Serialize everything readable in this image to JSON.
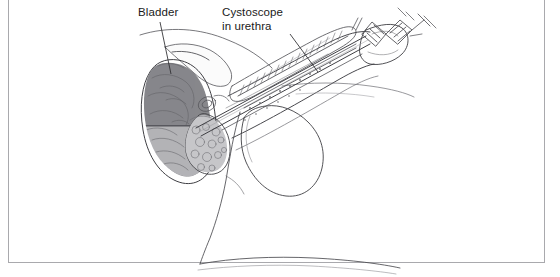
{
  "figure": {
    "view": "lateral cutaway",
    "background_color": "#ffffff",
    "frame": {
      "visible": true,
      "color": "#a9a9ad",
      "thickness_px": 1.5
    }
  },
  "labels": [
    {
      "id": "bladder",
      "text": "Bladder",
      "lines": [
        "Bladder"
      ],
      "x": 138,
      "y": 6,
      "color": "#1a1a1a",
      "leader": {
        "from_x": 160,
        "from_y": 22,
        "to_x": 171,
        "to_y": 72
      }
    },
    {
      "id": "cystoscope-in-urethra",
      "text": "Cystoscope in urethra",
      "lines": [
        "Cystoscope",
        "in urethra"
      ],
      "x": 222,
      "y": 6,
      "color": "#1a1a1a",
      "leader": {
        "from_x": 290,
        "from_y": 34,
        "to_x": 318,
        "to_y": 72
      }
    }
  ],
  "anatomy": {
    "structures": [
      {
        "name": "bladder",
        "fill": "#8b8b8e",
        "note": "dark gray filled dome, upper left"
      },
      {
        "name": "prostate",
        "fill": "#b5b5b8",
        "note": "lighter gray mass below bladder"
      },
      {
        "name": "penis-shaft",
        "fill": "none",
        "note": "outlined, angled up-right"
      },
      {
        "name": "scrotum",
        "fill": "none",
        "note": "outlined pendulous sac, center"
      },
      {
        "name": "urethra",
        "fill": "none",
        "note": "channel through shaft"
      },
      {
        "name": "pubic-bone",
        "fill": "none",
        "note": "outlined above bladder"
      },
      {
        "name": "body-contour",
        "fill": "none",
        "note": "perineum and thigh lines"
      }
    ]
  },
  "instrument": {
    "name": "cystoscope",
    "parts": [
      {
        "name": "shaft",
        "note": "long straight tube through urethra into bladder"
      },
      {
        "name": "sheath",
        "note": "outer tube along penis"
      },
      {
        "name": "eyepiece",
        "note": "ridged knurled head at upper right"
      },
      {
        "name": "light-post",
        "note": "small stub near eyepiece"
      }
    ],
    "stroke_color": "#555558"
  },
  "line_art": {
    "stroke_color": "#3f3f44",
    "light_stroke_color": "#8e8e93",
    "stroke_width": 0.8
  }
}
